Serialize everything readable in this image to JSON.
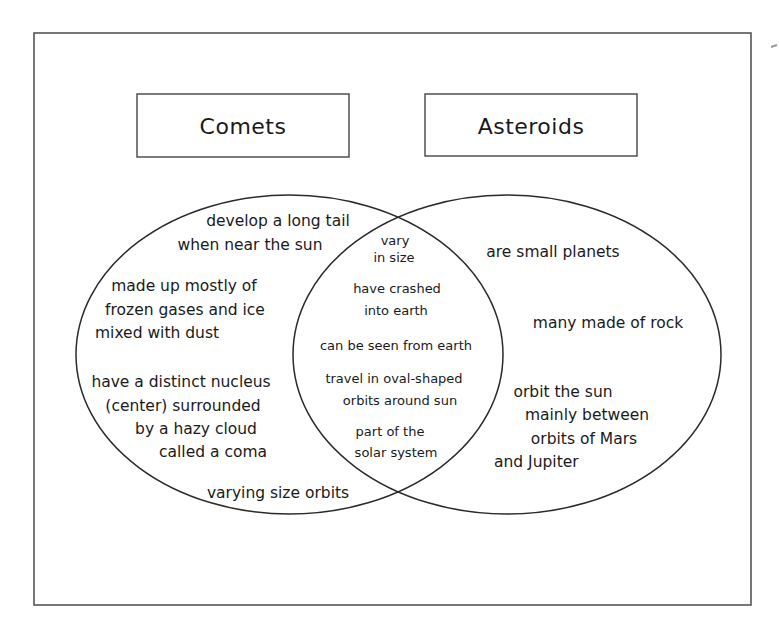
{
  "diagram": {
    "type": "venn",
    "sets": [
      {
        "id": "comets",
        "title": "Comets",
        "only_items": [
          [
            "develop a long tail",
            "when near the sun"
          ],
          [
            "made up mostly of",
            "frozen gases and ice",
            "mixed with dust"
          ],
          [
            "have a distinct nucleus",
            "(center) surrounded",
            "by a hazy cloud",
            "called a coma"
          ],
          [
            "varying size orbits"
          ]
        ]
      },
      {
        "id": "asteroids",
        "title": "Asteroids",
        "only_items": [
          [
            "are small planets"
          ],
          [
            "many made of rock"
          ],
          [
            "orbit the sun",
            "mainly between",
            "orbits of Mars",
            "and Jupiter"
          ]
        ]
      }
    ],
    "overlap_items": [
      [
        "vary",
        "in size"
      ],
      [
        "have crashed",
        "into earth"
      ],
      [
        "can be seen from earth"
      ],
      [
        "travel in oval-shaped",
        "orbits around sun"
      ],
      [
        "part of the",
        "solar system"
      ]
    ]
  },
  "colors": {
    "background": "#ffffff",
    "line": "#2a2a2a",
    "frame": "#555555",
    "text": "#1a1a1a"
  }
}
